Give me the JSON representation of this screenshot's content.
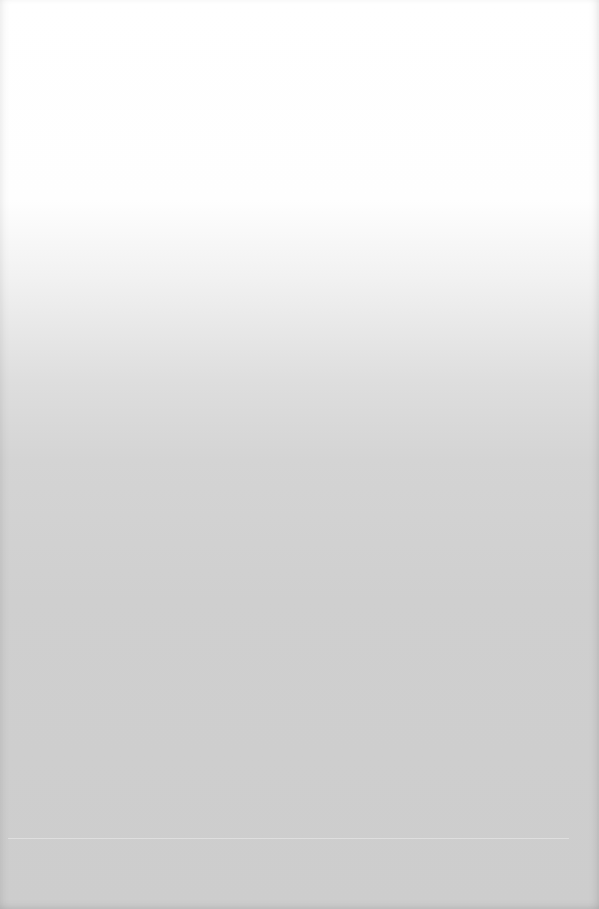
{
  "page": {
    "colors": {
      "top": "#ffffff",
      "middle": "#dedede",
      "bottom": "#cdcdcd"
    }
  }
}
